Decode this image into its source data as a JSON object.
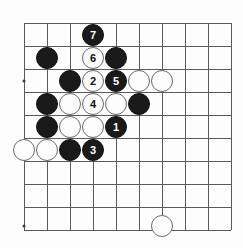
{
  "board": {
    "kind": "go-board-diagram",
    "columns": 10,
    "rows": 10,
    "origin_x": 24,
    "origin_y": 23,
    "spacing": 23,
    "line_color": "#5a5a5a",
    "background_color": "#fdfdfd",
    "black_color": "#1a1a1a",
    "white_color": "#fcfcfc",
    "star_points": [
      {
        "x": 24,
        "y": 81
      },
      {
        "x": 24,
        "y": 226
      }
    ],
    "stones": [
      {
        "color": "black",
        "x": 93,
        "y": 35,
        "label": "7"
      },
      {
        "color": "black",
        "x": 47,
        "y": 58,
        "label": ""
      },
      {
        "color": "white",
        "x": 93,
        "y": 58,
        "label": "6"
      },
      {
        "color": "black",
        "x": 116,
        "y": 58,
        "label": ""
      },
      {
        "color": "black",
        "x": 70,
        "y": 81,
        "label": ""
      },
      {
        "color": "white",
        "x": 93,
        "y": 81,
        "label": "2"
      },
      {
        "color": "black",
        "x": 116,
        "y": 81,
        "label": "5"
      },
      {
        "color": "white",
        "x": 139,
        "y": 81,
        "label": ""
      },
      {
        "color": "white",
        "x": 162,
        "y": 81,
        "label": ""
      },
      {
        "color": "black",
        "x": 47,
        "y": 104,
        "label": ""
      },
      {
        "color": "white",
        "x": 70,
        "y": 104,
        "label": ""
      },
      {
        "color": "white",
        "x": 93,
        "y": 104,
        "label": "4"
      },
      {
        "color": "white",
        "x": 116,
        "y": 104,
        "label": ""
      },
      {
        "color": "black",
        "x": 139,
        "y": 104,
        "label": ""
      },
      {
        "color": "black",
        "x": 47,
        "y": 127,
        "label": ""
      },
      {
        "color": "white",
        "x": 70,
        "y": 127,
        "label": ""
      },
      {
        "color": "white",
        "x": 93,
        "y": 127,
        "label": ""
      },
      {
        "color": "black",
        "x": 116,
        "y": 127,
        "label": "1"
      },
      {
        "color": "white",
        "x": 24,
        "y": 150,
        "label": ""
      },
      {
        "color": "white",
        "x": 47,
        "y": 150,
        "label": ""
      },
      {
        "color": "black",
        "x": 70,
        "y": 150,
        "label": ""
      },
      {
        "color": "black",
        "x": 93,
        "y": 150,
        "label": "3"
      },
      {
        "color": "white",
        "x": 162,
        "y": 226,
        "label": ""
      }
    ],
    "move_sequence": [
      {
        "number": "1",
        "color": "black"
      },
      {
        "number": "2",
        "color": "white"
      },
      {
        "number": "3",
        "color": "black"
      },
      {
        "number": "4",
        "color": "white"
      },
      {
        "number": "5",
        "color": "black"
      },
      {
        "number": "6",
        "color": "white"
      },
      {
        "number": "7",
        "color": "black"
      }
    ]
  }
}
